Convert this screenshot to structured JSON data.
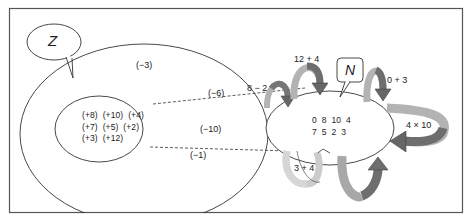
{
  "diagram": {
    "colors": {
      "frame": "#555555",
      "line": "#333333",
      "arrow_light": "#b8b8b8",
      "arrow_mid": "#8c8c8c",
      "arrow_dark": "#5e5e5e",
      "background": "#ffffff"
    },
    "callouts": {
      "set_z": "Z",
      "set_n": "N"
    },
    "z_set": {
      "outer_labels": {
        "top": "(−3)",
        "mid_upper": "(−6)",
        "middle": "(−10)",
        "bottom": "(−1)"
      },
      "inner_rows": [
        "(+8)  (+10)  (+4)",
        "(+7)  (+5)  (+2)",
        "(+3)  (+12)"
      ]
    },
    "n_set": {
      "rows": [
        "0  8  10  4",
        "7  5  2  3"
      ]
    },
    "operations": {
      "op_8_minus_2": "8 − 2",
      "op_12_plus_4": "12 + 4",
      "op_0_plus_3": "0 + 3",
      "op_4_times_10": "4 × 10",
      "op_3_plus_4": "3 + 4"
    }
  }
}
